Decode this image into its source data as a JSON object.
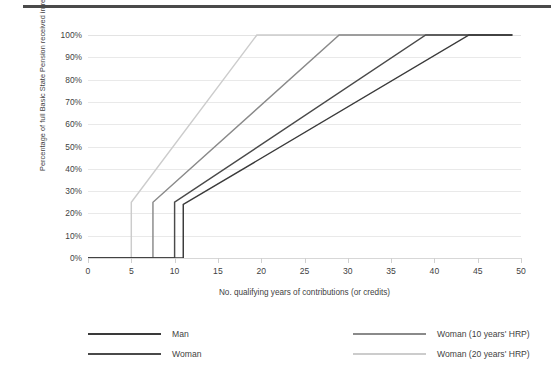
{
  "chart_data": {
    "type": "line",
    "title": "",
    "xlabel": "No. qualifying years of contributions (or credits)",
    "ylabel": "Percentage of full Basic State Pension received in retirement",
    "xlim": [
      0,
      50
    ],
    "ylim": [
      0,
      100
    ],
    "xticks": [
      "0",
      "5",
      "10",
      "15",
      "20",
      "25",
      "30",
      "35",
      "40",
      "45",
      "50"
    ],
    "xtick_values": [
      0,
      5,
      10,
      15,
      20,
      25,
      30,
      35,
      40,
      45,
      50
    ],
    "yticks": [
      "0%",
      "10%",
      "20%",
      "30%",
      "40%",
      "50%",
      "60%",
      "70%",
      "80%",
      "90%",
      "100%"
    ],
    "ytick_values": [
      0,
      10,
      20,
      30,
      40,
      50,
      60,
      70,
      80,
      90,
      100
    ],
    "grid": "horizontal",
    "legend_position": "bottom",
    "series": [
      {
        "name": "Man",
        "color": "#3a3a3a",
        "points": [
          [
            0,
            0
          ],
          [
            11,
            0
          ],
          [
            11,
            24
          ],
          [
            44,
            100
          ],
          [
            49,
            100
          ]
        ]
      },
      {
        "name": "Woman",
        "color": "#4a4a4a",
        "points": [
          [
            0,
            0
          ],
          [
            10,
            0
          ],
          [
            10,
            25
          ],
          [
            39,
            100
          ],
          [
            49,
            100
          ]
        ]
      },
      {
        "name": "Woman (10 years' HRP)",
        "color": "#8a8a8a",
        "points": [
          [
            0,
            0
          ],
          [
            7.5,
            0
          ],
          [
            7.5,
            25
          ],
          [
            29,
            100
          ],
          [
            49,
            100
          ]
        ]
      },
      {
        "name": "Woman (20 years' HRP)",
        "color": "#cccccc",
        "points": [
          [
            0,
            0
          ],
          [
            5,
            0
          ],
          [
            5,
            25
          ],
          [
            19.5,
            100
          ],
          [
            49,
            100
          ]
        ]
      }
    ]
  },
  "legend": {
    "entries": [
      {
        "label": "Man",
        "color": "#3a3a3a"
      },
      {
        "label": "Woman",
        "color": "#4a4a4a"
      },
      {
        "label": "Woman (10 years' HRP)",
        "color": "#8a8a8a"
      },
      {
        "label": "Woman (20 years' HRP)",
        "color": "#cccccc"
      }
    ]
  },
  "colors": {
    "grid": "#e9e9e9",
    "axis": "#d7d7d7",
    "text": "#3f3f3f",
    "rule": "#4a4a4a",
    "background": "#ffffff"
  }
}
